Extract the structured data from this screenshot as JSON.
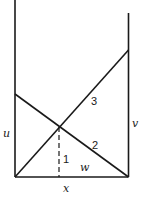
{
  "diagram": {
    "labels": {
      "left_height": "u",
      "right_height": "v",
      "base_segment": "x",
      "line_1": "1",
      "line_2": "2",
      "line_3": "3",
      "baseline_region": "w"
    },
    "colors": {
      "stroke": "#1a1a1a",
      "background": "#ffffff"
    }
  }
}
